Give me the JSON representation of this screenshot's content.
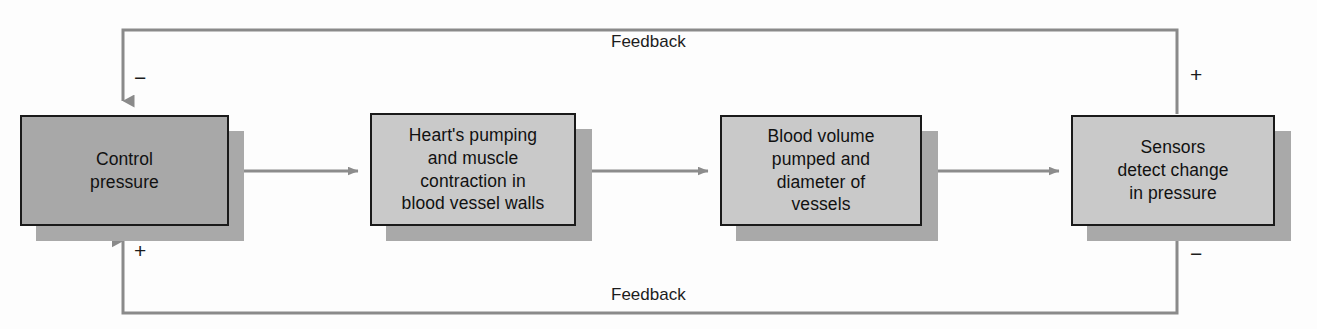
{
  "diagram": {
    "background_color": "#fdfdfd",
    "box_fill_primary": "#a8a8a8",
    "box_fill_secondary": "#c9c9c9",
    "box_border_color": "#1a1a1a",
    "shadow_color": "#a9a9a9",
    "connector_color": "#8c8c8c",
    "feedback_line_color": "#8a8a8a",
    "nodes": [
      {
        "id": "control-pressure",
        "label": "Control\npressure",
        "fill": "primary"
      },
      {
        "id": "heart-pumping",
        "label": "Heart's pumping\nand muscle\ncontraction in\nblood vessel walls",
        "fill": "secondary"
      },
      {
        "id": "blood-volume",
        "label": "Blood volume\npumped and\ndiameter of\nvessels",
        "fill": "secondary"
      },
      {
        "id": "sensors",
        "label": "Sensors\ndetect change\nin pressure",
        "fill": "secondary"
      }
    ],
    "feedback_top": {
      "label": "Feedback",
      "sign_left": "−",
      "sign_right": "+"
    },
    "feedback_bottom": {
      "label": "Feedback",
      "sign_left": "+",
      "sign_right": "−"
    }
  }
}
